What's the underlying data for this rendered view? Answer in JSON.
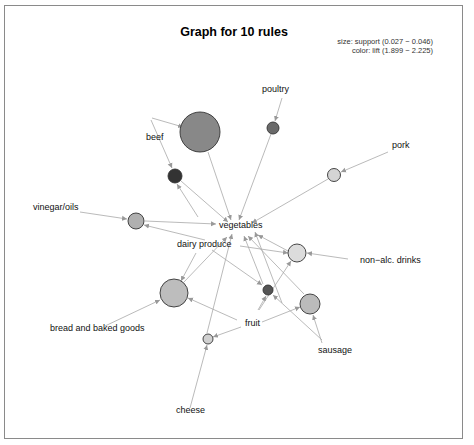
{
  "chart_data": {
    "type": "network",
    "title": "Graph for 10 rules",
    "legend": {
      "size": "size: support (0.027 − 0.046)",
      "color": "color: lift (1.899 − 2.225)"
    },
    "item_labels": [
      {
        "id": "poultry",
        "text": "poultry",
        "x": 262,
        "y": 92
      },
      {
        "id": "beef",
        "text": "beef",
        "x": 146,
        "y": 140
      },
      {
        "id": "pork",
        "text": "pork",
        "x": 392,
        "y": 148
      },
      {
        "id": "vinegar_oils",
        "text": "vinegar/oils",
        "x": 33,
        "y": 210
      },
      {
        "id": "vegetables",
        "text": "vegetables",
        "x": 219,
        "y": 228
      },
      {
        "id": "dairy_produce",
        "text": "dairy produce",
        "x": 177,
        "y": 247
      },
      {
        "id": "non_alc_drinks",
        "text": "non−alc. drinks",
        "x": 360,
        "y": 263
      },
      {
        "id": "bread",
        "text": "bread and baked goods",
        "x": 50,
        "y": 331
      },
      {
        "id": "fruit",
        "text": "fruit",
        "x": 245,
        "y": 326
      },
      {
        "id": "sausage",
        "text": "sausage",
        "x": 318,
        "y": 353
      },
      {
        "id": "cheese",
        "text": "cheese",
        "x": 176,
        "y": 413
      }
    ],
    "rule_nodes": [
      {
        "id": "r1",
        "x": 200,
        "y": 132,
        "r": 20,
        "color": "#888888"
      },
      {
        "id": "r2",
        "x": 273,
        "y": 128,
        "r": 6,
        "color": "#6a6a6a"
      },
      {
        "id": "r3",
        "x": 175,
        "y": 176,
        "r": 7,
        "color": "#333333"
      },
      {
        "id": "r4",
        "x": 334,
        "y": 175,
        "r": 6.5,
        "color": "#d4d4d4"
      },
      {
        "id": "r5",
        "x": 136,
        "y": 221,
        "r": 8,
        "color": "#b0b0b0"
      },
      {
        "id": "r6",
        "x": 297,
        "y": 253,
        "r": 9,
        "color": "#dcdcdc"
      },
      {
        "id": "r7",
        "x": 174,
        "y": 293,
        "r": 14,
        "color": "#bdbdbd"
      },
      {
        "id": "r8",
        "x": 268,
        "y": 290,
        "r": 5,
        "color": "#555555"
      },
      {
        "id": "r9",
        "x": 310,
        "y": 304,
        "r": 10,
        "color": "#bbbbbb"
      },
      {
        "id": "r10",
        "x": 208,
        "y": 339,
        "r": 5,
        "color": "#d0d0d0"
      }
    ],
    "edges": [
      {
        "from": [
          152,
          118
        ],
        "to": [
          183,
          127
        ]
      },
      {
        "from": [
          151,
          120
        ],
        "to": [
          172,
          168
        ]
      },
      {
        "from": [
          208,
          152
        ],
        "to": [
          231,
          220
        ]
      },
      {
        "from": [
          282,
          98
        ],
        "to": [
          275,
          121
        ]
      },
      {
        "from": [
          271,
          134
        ],
        "to": [
          239,
          220
        ]
      },
      {
        "from": [
          181,
          181
        ],
        "to": [
          228,
          222
        ]
      },
      {
        "from": [
          388,
          152
        ],
        "to": [
          341,
          172
        ]
      },
      {
        "from": [
          328,
          179
        ],
        "to": [
          252,
          223
        ]
      },
      {
        "from": [
          80,
          212
        ],
        "to": [
          127,
          219
        ]
      },
      {
        "from": [
          145,
          221
        ],
        "to": [
          216,
          224
        ]
      },
      {
        "from": [
          205,
          240
        ],
        "to": [
          144,
          225
        ]
      },
      {
        "from": [
          198,
          217
        ],
        "to": [
          177,
          184
        ]
      },
      {
        "from": [
          348,
          259
        ],
        "to": [
          307,
          253
        ]
      },
      {
        "from": [
          288,
          251
        ],
        "to": [
          258,
          235
        ]
      },
      {
        "from": [
          240,
          246
        ],
        "to": [
          288,
          253
        ]
      },
      {
        "from": [
          105,
          326
        ],
        "to": [
          160,
          300
        ]
      },
      {
        "from": [
          184,
          282
        ],
        "to": [
          227,
          237
        ]
      },
      {
        "from": [
          196,
          253
        ],
        "to": [
          181,
          281
        ]
      },
      {
        "from": [
          237,
          320
        ],
        "to": [
          188,
          298
        ]
      },
      {
        "from": [
          262,
          322
        ],
        "to": [
          300,
          307
        ]
      },
      {
        "from": [
          241,
          327
        ],
        "to": [
          213,
          337
        ]
      },
      {
        "from": [
          212,
          250
        ],
        "to": [
          262,
          285
        ]
      },
      {
        "from": [
          263,
          284
        ],
        "to": [
          244,
          236
        ]
      },
      {
        "from": [
          259,
          310
        ],
        "to": [
          291,
          261
        ]
      },
      {
        "from": [
          258,
          310
        ],
        "to": [
          266,
          296
        ]
      },
      {
        "from": [
          322,
          343
        ],
        "to": [
          313,
          315
        ]
      },
      {
        "from": [
          322,
          340
        ],
        "to": [
          273,
          295
        ]
      },
      {
        "from": [
          304,
          294
        ],
        "to": [
          248,
          236
        ]
      },
      {
        "from": [
          282,
          303
        ],
        "to": [
          255,
          232
        ]
      },
      {
        "from": [
          190,
          408
        ],
        "to": [
          207,
          345
        ]
      },
      {
        "from": [
          207,
          333
        ],
        "to": [
          232,
          234
        ]
      }
    ]
  }
}
